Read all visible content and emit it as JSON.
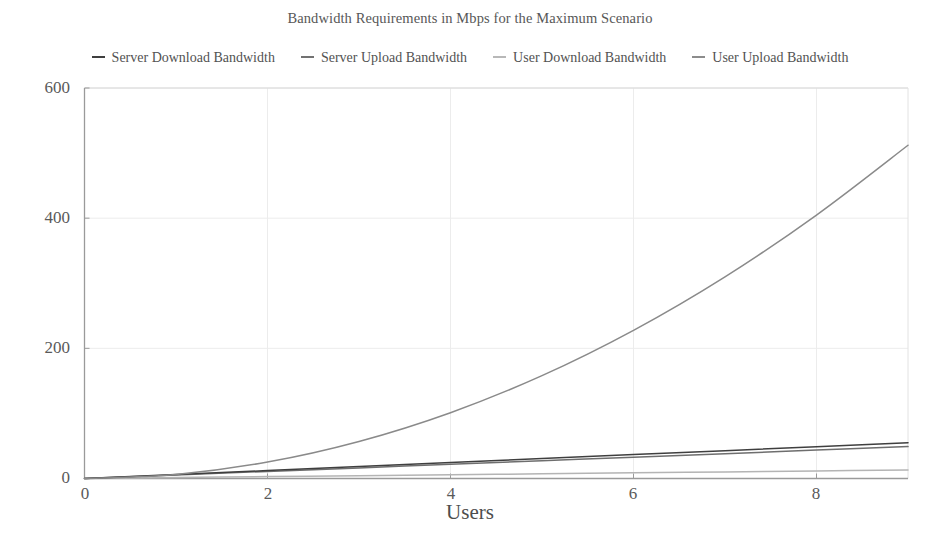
{
  "chart_data": {
    "type": "line",
    "title": "Bandwidth Requirements in Mbps for the Maximum Scenario",
    "xlabel": "Users",
    "ylabel": "",
    "xlim": [
      0,
      9
    ],
    "ylim": [
      0,
      600
    ],
    "xticks": [
      0,
      2,
      4,
      6,
      8
    ],
    "yticks": [
      0,
      200,
      400,
      600
    ],
    "xtick_labels": [
      "0",
      "2",
      "4",
      "6",
      "8"
    ],
    "ytick_labels": [
      "0",
      "200",
      "400",
      "600"
    ],
    "grid": true,
    "legend_position": "top",
    "x": [
      0,
      1,
      2,
      3,
      4,
      5,
      6,
      7,
      8,
      9
    ],
    "series": [
      {
        "name": "Server Download Bandwidth",
        "color": "#3f3f3f",
        "values": [
          0,
          6.1,
          12.2,
          18.3,
          24.4,
          30.6,
          36.7,
          42.8,
          48.9,
          55.0
        ]
      },
      {
        "name": "Server Upload Bandwidth",
        "color": "#6e6e6e",
        "values": [
          0,
          5.4,
          10.9,
          16.3,
          21.8,
          27.2,
          32.7,
          38.1,
          43.6,
          49.0
        ]
      },
      {
        "name": "User Download Bandwidth",
        "color": "#b4b4b4",
        "values": [
          0,
          1.4,
          2.9,
          4.3,
          5.8,
          7.2,
          8.7,
          10.1,
          11.6,
          13.0
        ]
      },
      {
        "name": "User Upload Bandwidth",
        "color": "#8a8a8a",
        "values": [
          0,
          6.3,
          25.3,
          56.9,
          101.1,
          158.0,
          227.6,
          309.8,
          404.8,
          512.0
        ]
      }
    ]
  },
  "legend": {
    "items": [
      {
        "label": "Server Download Bandwidth",
        "marker": "dash-marker",
        "color": "#3f3f3f"
      },
      {
        "label": "Server Upload Bandwidth",
        "marker": "dash-marker",
        "color": "#727272"
      },
      {
        "label": "User Download Bandwidth",
        "marker": "dash-marker",
        "color": "#b8b8b8"
      },
      {
        "label": "User Upload Bandwidth",
        "marker": "dash-marker",
        "color": "#8c8c8c"
      }
    ]
  },
  "axes": {
    "y_labels": [
      "600",
      "400",
      "200",
      "0"
    ],
    "x_labels": [
      "0",
      "2",
      "4",
      "6",
      "8"
    ],
    "x_axis_title": "Users"
  }
}
